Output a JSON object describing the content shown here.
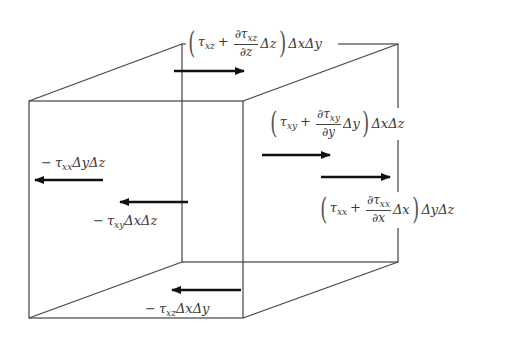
{
  "diagram": {
    "cube": {
      "front_face": {
        "x1": 29,
        "y1": 101,
        "x2": 243,
        "y2": 318
      },
      "back_face": {
        "x1": 182,
        "y1": 44,
        "x2": 398,
        "y2": 262
      },
      "stroke": "#444444"
    },
    "arrows": [
      {
        "name": "top-face-arrow",
        "x1": 174,
        "y1": 71,
        "x2": 244,
        "y2": 71,
        "direction": "right"
      },
      {
        "name": "right-face-arrow-xy",
        "x1": 262,
        "y1": 155,
        "x2": 330,
        "y2": 155,
        "direction": "right"
      },
      {
        "name": "right-face-arrow-xx",
        "x1": 321,
        "y1": 177,
        "x2": 390,
        "y2": 177,
        "direction": "right"
      },
      {
        "name": "left-face-arrow-xx",
        "x1": 103,
        "y1": 180,
        "x2": 35,
        "y2": 180,
        "direction": "left"
      },
      {
        "name": "back-face-arrow-xy",
        "x1": 188,
        "y1": 202,
        "x2": 120,
        "y2": 202,
        "direction": "left"
      },
      {
        "name": "bottom-face-arrow-xz",
        "x1": 241,
        "y1": 290,
        "x2": 172,
        "y2": 290,
        "direction": "left"
      }
    ],
    "labels": {
      "top": {
        "tau": "τ",
        "sub": "xz",
        "plus": "+",
        "num_d": "∂τ",
        "num_sub": "xz",
        "den": "∂z",
        "delta": "Δz",
        "tail": "ΔxΔy"
      },
      "right_xy": {
        "tau": "τ",
        "sub": "xy",
        "plus": "+",
        "num_d": "∂τ",
        "num_sub": "xy",
        "den": "∂y",
        "delta": "Δy",
        "tail": "ΔxΔz"
      },
      "right_xx": {
        "tau": "τ",
        "sub": "xx",
        "plus": "+",
        "num_d": "∂τ",
        "num_sub": "xx",
        "den": "∂x",
        "delta": "Δx",
        "tail": "ΔyΔz"
      },
      "left_xx": {
        "minus": "−",
        "tau": "τ",
        "sub": "xx",
        "tail": "ΔyΔz"
      },
      "back_xy": {
        "minus": "−",
        "tau": "τ",
        "sub": "xy",
        "tail": "ΔxΔz"
      },
      "bottom_xz": {
        "minus": "−",
        "tau": "τ",
        "sub": "xz",
        "tail": "ΔxΔy"
      }
    },
    "paren_open": "(",
    "paren_close": ")"
  }
}
